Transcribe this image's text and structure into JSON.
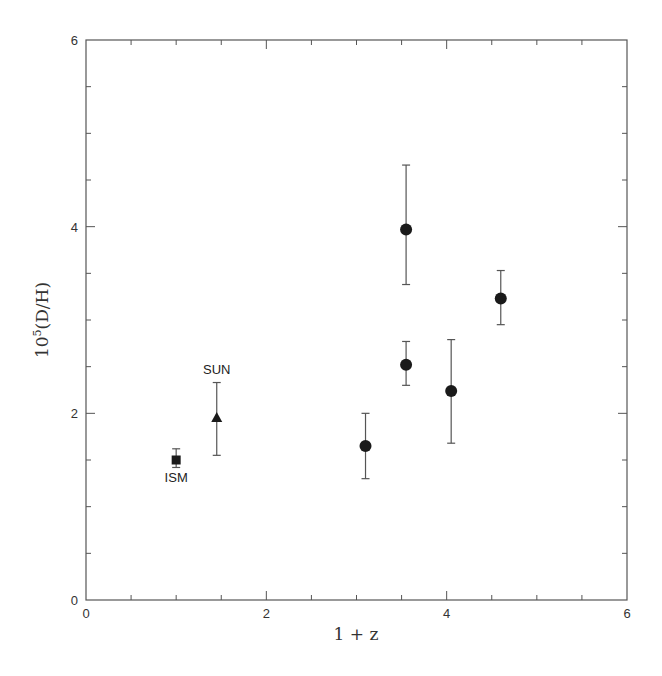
{
  "chart_data": {
    "type": "scatter",
    "title": "",
    "xlabel": "1 + z",
    "ylabel": "10^5(D/H)",
    "ylabel_base": "10",
    "ylabel_sup": "5",
    "ylabel_rest": "(D/H)",
    "xlim": [
      0,
      6
    ],
    "ylim": [
      0,
      6
    ],
    "x_ticks_major": [
      0,
      2,
      4,
      6
    ],
    "x_ticks_minor_step": 0.5,
    "y_ticks_major": [
      0,
      2,
      4,
      6
    ],
    "y_ticks_minor_step": 0.5,
    "grid": false,
    "series": [
      {
        "name": "ISM",
        "marker": "square",
        "annotation": "ISM",
        "annotation_position": "below",
        "points": [
          {
            "x": 1.0,
            "y": 1.5,
            "y_lo": 1.42,
            "y_hi": 1.62
          }
        ]
      },
      {
        "name": "SUN",
        "marker": "triangle",
        "annotation": "SUN",
        "annotation_position": "above",
        "points": [
          {
            "x": 1.45,
            "y": 1.95,
            "y_lo": 1.55,
            "y_hi": 2.33
          }
        ]
      },
      {
        "name": "QSO absorbers",
        "marker": "circle",
        "points": [
          {
            "x": 3.1,
            "y": 1.65,
            "y_lo": 1.3,
            "y_hi": 2.0
          },
          {
            "x": 3.55,
            "y": 3.97,
            "y_lo": 3.38,
            "y_hi": 4.66
          },
          {
            "x": 3.55,
            "y": 2.52,
            "y_lo": 2.3,
            "y_hi": 2.77
          },
          {
            "x": 4.05,
            "y": 2.24,
            "y_lo": 1.68,
            "y_hi": 2.79
          },
          {
            "x": 4.6,
            "y": 3.23,
            "y_lo": 2.95,
            "y_hi": 3.53
          }
        ]
      }
    ]
  }
}
